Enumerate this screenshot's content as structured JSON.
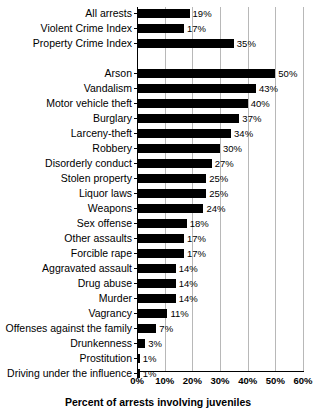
{
  "chart_data": {
    "type": "bar",
    "orientation": "horizontal",
    "title": "",
    "subtitle": "",
    "xlabel": "Percent of arrests involving juveniles",
    "ylabel": "",
    "xlim": [
      0,
      60
    ],
    "xtick_labels": [
      "0%",
      "10%",
      "20%",
      "30%",
      "40%",
      "50%",
      "60%"
    ],
    "xticks": [
      0,
      10,
      20,
      30,
      40,
      50,
      60
    ],
    "grid": true,
    "legend": false,
    "bar_color": "#000000",
    "gridline_color": "#b8b8b8",
    "axis_color": "#000000",
    "value_label_suffix": "%",
    "groups": [
      {
        "name": "summary",
        "categories": [
          "All arrests",
          "Violent Crime Index",
          "Property Crime Index"
        ],
        "values": [
          19,
          17,
          35
        ],
        "value_labels": [
          "19%",
          "17%",
          "35%"
        ]
      },
      {
        "name": "offenses",
        "categories": [
          "Arson",
          "Vandalism",
          "Motor vehicle theft",
          "Burglary",
          "Larceny-theft",
          "Robbery",
          "Disorderly conduct",
          "Stolen property",
          "Liquor laws",
          "Weapons",
          "Sex offense",
          "Other assaults",
          "Forcible rape",
          "Aggravated assault",
          "Drug abuse",
          "Murder",
          "Vagrancy",
          "Offenses against the family",
          "Drunkenness",
          "Prostitution",
          "Driving under the influence"
        ],
        "values": [
          50,
          43,
          40,
          37,
          34,
          30,
          27,
          25,
          25,
          24,
          18,
          17,
          17,
          14,
          14,
          14,
          11,
          7,
          3,
          1,
          1
        ],
        "value_labels": [
          "50%",
          "43%",
          "40%",
          "37%",
          "34%",
          "30%",
          "27%",
          "25%",
          "25%",
          "24%",
          "18%",
          "17%",
          "17%",
          "14%",
          "14%",
          "14%",
          "11%",
          "7%",
          "3%",
          "1%",
          "1%"
        ]
      }
    ],
    "categories": [
      "All arrests",
      "Violent Crime Index",
      "Property Crime Index",
      "Arson",
      "Vandalism",
      "Motor vehicle theft",
      "Burglary",
      "Larceny-theft",
      "Robbery",
      "Disorderly conduct",
      "Stolen property",
      "Liquor laws",
      "Weapons",
      "Sex offense",
      "Other assaults",
      "Forcible rape",
      "Aggravated assault",
      "Drug abuse",
      "Murder",
      "Vagrancy",
      "Offenses against the family",
      "Drunkenness",
      "Prostitution",
      "Driving under the influence"
    ],
    "values": [
      19,
      17,
      35,
      50,
      43,
      40,
      37,
      34,
      30,
      27,
      25,
      25,
      24,
      18,
      17,
      17,
      14,
      14,
      14,
      11,
      7,
      3,
      1,
      1
    ]
  }
}
